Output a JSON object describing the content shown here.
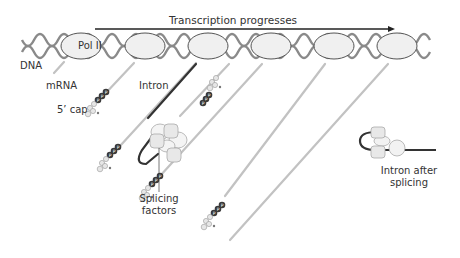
{
  "title": "Transcription progresses",
  "labels": {
    "dna": "DNA",
    "pol": "Pol II",
    "mrna": "mRNA",
    "cap": "5’ cap",
    "intron": "Intron",
    "splicing_1": "Splicing",
    "splicing_2": "factors",
    "after_1": "Intron after",
    "after_2": "splicing"
  },
  "colors": {
    "dna": "#8a8a8a",
    "ellipse_fill": "#f0f0f0",
    "ellipse_stroke": "#555555",
    "mrna": "#bdbdbd",
    "intron": "#333333",
    "phosphate": "#444444",
    "arrow": "#222222"
  },
  "polymerases": [
    {
      "cx": 73,
      "cy": 46
    },
    {
      "cx": 149,
      "cy": 46
    },
    {
      "cx": 212,
      "cy": 46
    },
    {
      "cx": 277,
      "cy": 46
    },
    {
      "cx": 340,
      "cy": 46
    },
    {
      "cx": 403,
      "cy": 46
    }
  ],
  "strands": [
    {
      "x1": 73,
      "y1": 64,
      "x2": 62,
      "y2": 75,
      "cap": null,
      "ppp": null
    },
    {
      "x1": 134,
      "y1": 64,
      "x2": 94,
      "y2": 110,
      "cap": [
        86,
        118
      ],
      "ppp": [
        106,
        96
      ]
    },
    {
      "x1": 197,
      "y1": 64,
      "x2": 110,
      "y2": 150,
      "cap": [
        100,
        170
      ],
      "ppp": [
        120,
        146
      ]
    },
    {
      "x1": 262,
      "y1": 64,
      "x2": 170,
      "y2": 160,
      "cap": [
        157,
        196
      ],
      "ppp": [
        175,
        176
      ]
    },
    {
      "x1": 325,
      "y1": 64,
      "x2": 220,
      "y2": 180,
      "cap": [
        205,
        220
      ],
      "ppp": [
        225,
        196
      ]
    },
    {
      "x1": 390,
      "y1": 64,
      "x2": 235,
      "y2": 210,
      "cap": null,
      "ppp": null
    }
  ],
  "ppp_strand3b": {
    "ppp": [
      211,
      91
    ],
    "cap": [
      220,
      78
    ]
  }
}
